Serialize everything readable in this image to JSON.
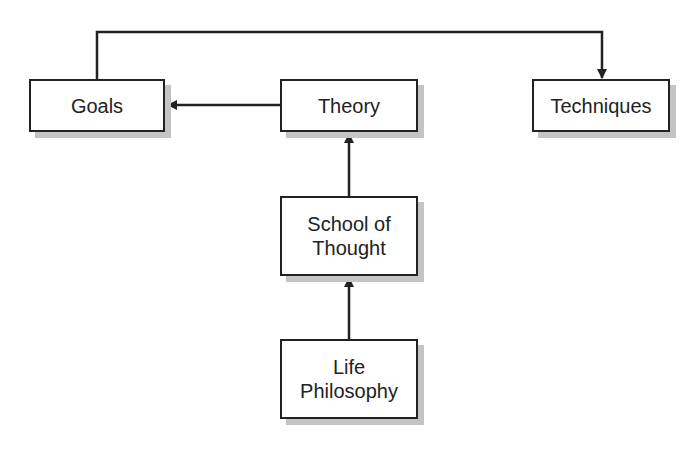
{
  "diagram": {
    "type": "flowchart",
    "nodes": [
      {
        "id": "goals",
        "label": "Goals"
      },
      {
        "id": "theory",
        "label": "Theory"
      },
      {
        "id": "techniques",
        "label": "Techniques"
      },
      {
        "id": "school",
        "label_line1": "School of",
        "label_line2": "Thought"
      },
      {
        "id": "life",
        "label_line1": "Life",
        "label_line2": "Philosophy"
      }
    ],
    "edges": [
      {
        "from": "Goals",
        "to": "Techniques"
      },
      {
        "from": "Theory",
        "to": "Goals"
      },
      {
        "from": "School of Thought",
        "to": "Theory"
      },
      {
        "from": "Life Philosophy",
        "to": "School of Thought"
      }
    ],
    "colors": {
      "stroke": "#222222",
      "shadow": "#c4c4c4",
      "background": "#ffffff"
    }
  }
}
